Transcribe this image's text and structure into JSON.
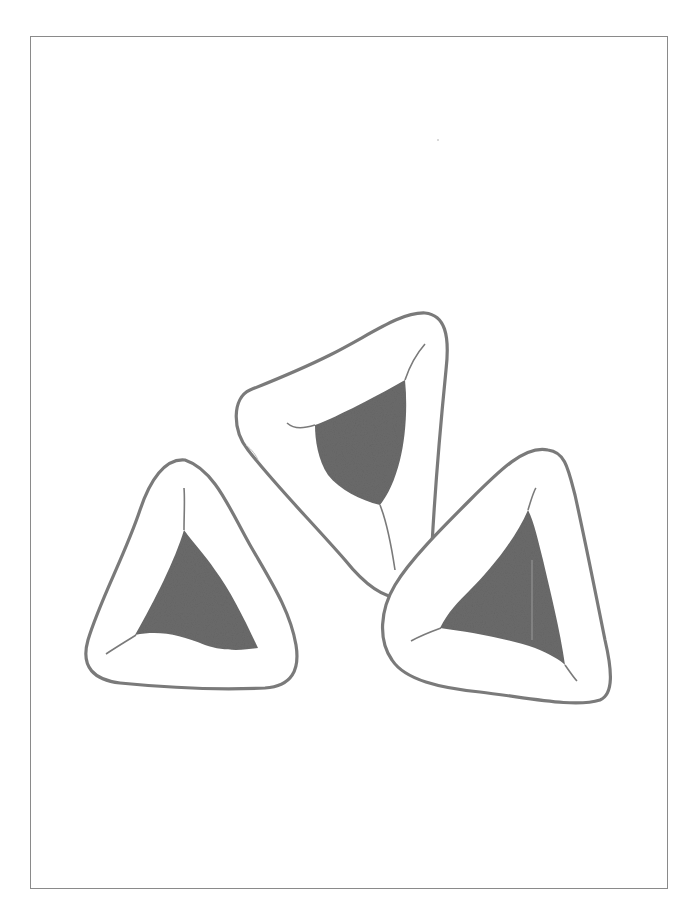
{
  "page": {
    "header": {
      "left": "",
      "right": ""
    },
    "figure": {
      "description": "Line illustration of three triangular filled pastries (hamantaschen)",
      "pastries": [
        {
          "id": "left-pastry",
          "label": "pastry"
        },
        {
          "id": "center-pastry",
          "label": "pastry"
        },
        {
          "id": "right-pastry",
          "label": "pastry"
        }
      ],
      "colors": {
        "outline": "#7a7a7a",
        "filling": "#6b6b6b",
        "frame": "#8a8a8a"
      }
    }
  }
}
